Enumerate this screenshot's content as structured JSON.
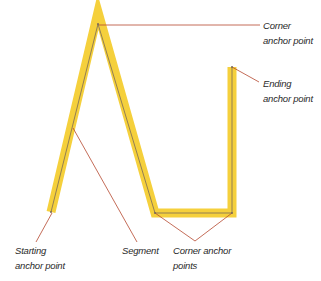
{
  "diagram": {
    "colors": {
      "highlight": "#f5d03c",
      "path": "#7a6a58",
      "leader": "#b5482e",
      "text": "#2a2a2a"
    },
    "path_points": [
      {
        "id": "start",
        "x": 51,
        "y": 212
      },
      {
        "id": "peak",
        "x": 98,
        "y": 24
      },
      {
        "id": "bottom-left",
        "x": 155,
        "y": 213
      },
      {
        "id": "bottom-right",
        "x": 232,
        "y": 213
      },
      {
        "id": "end",
        "x": 232,
        "y": 67
      }
    ],
    "labels": {
      "corner_top": {
        "line1": "Corner",
        "line2": "anchor point"
      },
      "ending": {
        "line1": "Ending",
        "line2": "anchor point"
      },
      "starting": {
        "line1": "Starting",
        "line2": "anchor point"
      },
      "segment": {
        "line1": "Segment"
      },
      "corner_bottom": {
        "line1": "Corner anchor",
        "line2": "points"
      }
    }
  }
}
